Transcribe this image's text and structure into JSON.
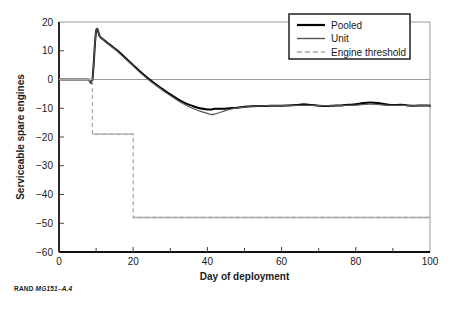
{
  "source_note": {
    "brand": "RAND",
    "figure_id": "MG151–A.4"
  },
  "legend": {
    "items": [
      {
        "label": "Pooled",
        "style": "solid-thick-black",
        "color": "#000000"
      },
      {
        "label": "Unit",
        "style": "solid-thin-gray",
        "color": "#555555"
      },
      {
        "label": "Engine threshold",
        "style": "dashed-gray",
        "color": "#aaaaaa"
      }
    ]
  },
  "chart_data": {
    "type": "line",
    "title": "",
    "xlabel": "Day of deployment",
    "ylabel": "Serviceable spare engines",
    "xlim": [
      0,
      100
    ],
    "ylim": [
      -60,
      20
    ],
    "xticks": [
      0,
      20,
      40,
      60,
      80,
      100
    ],
    "xminorticks": [
      10,
      30,
      50,
      70,
      90
    ],
    "yticks": [
      20,
      10,
      0,
      -10,
      -20,
      -30,
      -40,
      -50,
      -60
    ],
    "grid": false,
    "legend_position": "top-right",
    "annotations": [],
    "series": [
      {
        "name": "Pooled",
        "color": "#000000",
        "x": [
          0,
          1,
          2,
          3,
          4,
          5,
          6,
          7,
          8,
          9,
          10,
          11,
          12,
          13,
          14,
          15,
          16,
          17,
          18,
          19,
          20,
          22,
          24,
          26,
          28,
          30,
          32,
          34,
          36,
          38,
          40,
          41,
          42,
          44,
          46,
          48,
          50,
          52,
          54,
          56,
          58,
          60,
          62,
          64,
          66,
          68,
          70,
          72,
          74,
          76,
          78,
          80,
          82,
          84,
          86,
          88,
          90,
          92,
          94,
          96,
          98,
          100
        ],
        "y": [
          0,
          0,
          0,
          0,
          0,
          0,
          0,
          0,
          0,
          0,
          16.8,
          15.0,
          13.8,
          12.8,
          11.8,
          10.8,
          9.8,
          8.6,
          7.4,
          6.2,
          5.0,
          2.6,
          0.4,
          -1.6,
          -3.4,
          -5.2,
          -6.8,
          -8.2,
          -9.2,
          -10.0,
          -10.4,
          -10.4,
          -10.2,
          -10.2,
          -10.0,
          -9.8,
          -9.5,
          -9.3,
          -9.2,
          -9.2,
          -9.1,
          -9.1,
          -9.0,
          -8.9,
          -8.6,
          -8.9,
          -9.1,
          -9.2,
          -9.1,
          -9.0,
          -8.8,
          -8.6,
          -8.2,
          -8.0,
          -8.2,
          -8.6,
          -8.9,
          -8.8,
          -9.0,
          -9.1,
          -9.0,
          -9.1
        ]
      },
      {
        "name": "Unit",
        "color": "#555555",
        "x": [
          0,
          1,
          2,
          3,
          4,
          5,
          6,
          7,
          8,
          9,
          10,
          11,
          12,
          13,
          14,
          15,
          16,
          17,
          18,
          19,
          20,
          22,
          24,
          26,
          28,
          30,
          32,
          34,
          36,
          38,
          40,
          41,
          42,
          44,
          46,
          48,
          50,
          52,
          54,
          56,
          58,
          60,
          62,
          64,
          66,
          68,
          70,
          72,
          74,
          76,
          78,
          80,
          82,
          84,
          86,
          88,
          90,
          92,
          94,
          96,
          98,
          100
        ],
        "y": [
          0,
          0,
          0,
          0,
          0,
          0,
          0,
          0,
          0,
          0,
          16.8,
          15.0,
          13.7,
          12.6,
          11.6,
          10.6,
          9.5,
          8.3,
          7.1,
          5.9,
          4.7,
          2.3,
          0.1,
          -1.9,
          -3.8,
          -5.6,
          -7.3,
          -8.8,
          -10.0,
          -11.0,
          -11.8,
          -12.2,
          -12.0,
          -11.2,
          -10.4,
          -9.9,
          -9.6,
          -9.3,
          -9.2,
          -9.1,
          -9.1,
          -9.1,
          -9.0,
          -9.0,
          -9.0,
          -9.0,
          -9.1,
          -9.1,
          -9.1,
          -9.1,
          -9.0,
          -8.9,
          -8.7,
          -8.6,
          -8.7,
          -8.9,
          -9.0,
          -9.0,
          -9.0,
          -9.1,
          -9.1,
          -9.1
        ]
      },
      {
        "name": "Engine threshold",
        "color": "#aaaaaa",
        "x": [
          0,
          9,
          9,
          20,
          20,
          100
        ],
        "y": [
          0,
          0,
          -19,
          -19,
          -48,
          -48
        ],
        "step": true
      }
    ]
  }
}
